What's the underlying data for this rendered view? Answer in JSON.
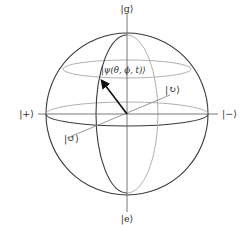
{
  "figure": {
    "labels": {
      "top": "|g⟩",
      "bottom": "|e⟩",
      "left": "|+⟩",
      "right": "|−⟩",
      "back_diagonal": "|↻⟩",
      "front_diagonal": "|↺⟩",
      "state_vector": "|ψ(θ, ϕ, t)⟩"
    },
    "colors": {
      "front_lines": "#3a3a3a",
      "back_lines": "#a8a8a8",
      "axes": "#6a6a6a",
      "state_vector": "#111111",
      "background": "#ffffff"
    }
  }
}
